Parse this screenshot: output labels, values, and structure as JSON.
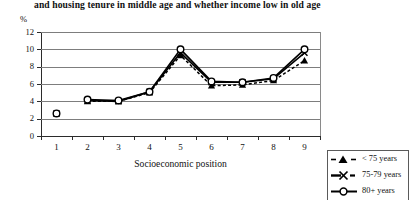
{
  "title": "and housing tenure in middle age and whether income low in old age",
  "axis": {
    "y_unit_label": "%",
    "x_title": "Socioeconomic position",
    "y_ticks": [
      "0",
      "2",
      "4",
      "6",
      "8",
      "10",
      "12"
    ],
    "x_ticks": [
      "1",
      "2",
      "3",
      "4",
      "5",
      "6",
      "7",
      "8",
      "9"
    ]
  },
  "legend": {
    "items": [
      {
        "label": "< 75 years",
        "marker": "triangle",
        "line": "dashed",
        "color": "#000000"
      },
      {
        "label": "75-79 years",
        "marker": "x",
        "line": "solid",
        "color": "#000000"
      },
      {
        "label": "80+ years",
        "marker": "circle",
        "line": "solid",
        "color": "#000000"
      }
    ]
  },
  "chart_data": {
    "type": "line",
    "title": "and housing tenure in middle age and whether income low in old age",
    "xlabel": "Socioeconomic position",
    "ylabel": "%",
    "ylim": [
      0,
      12
    ],
    "ytick_step": 2,
    "grid": true,
    "legend_position": "bottom-right",
    "categories": [
      "1",
      "2",
      "3",
      "4",
      "5",
      "6",
      "7",
      "8",
      "9"
    ],
    "series": [
      {
        "name": "< 75 years",
        "marker": "triangle",
        "line": "dashed",
        "values": [
          2.6,
          4.0,
          4.0,
          5.0,
          9.3,
          5.8,
          5.9,
          6.4,
          8.7
        ]
      },
      {
        "name": "75-79 years",
        "marker": "x",
        "line": "solid",
        "values": [
          2.6,
          4.1,
          4.0,
          5.1,
          9.6,
          6.2,
          6.2,
          6.6,
          9.6
        ]
      },
      {
        "name": "80+ years",
        "marker": "circle",
        "line": "solid",
        "values": [
          2.6,
          4.2,
          4.1,
          5.1,
          10.0,
          6.3,
          6.2,
          6.7,
          10.0
        ]
      }
    ]
  }
}
